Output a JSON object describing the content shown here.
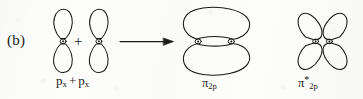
{
  "figure": {
    "panel_label": "(b)",
    "type": "molecular-orbital-diagram",
    "ink_color": "#1a1a1a",
    "background_color": "#fdfdfb"
  },
  "reactants": {
    "left_orbital_name": "p-orbital",
    "right_orbital_name": "p-orbital",
    "operator": "+",
    "caption": {
      "first_symbol": "p",
      "first_subscript": "x",
      "operator": "+",
      "second_symbol": "p",
      "second_subscript": "x"
    }
  },
  "arrow": {
    "name": "reaction-arrow",
    "direction": "right"
  },
  "products": [
    {
      "name": "pi-bonding-orbital",
      "caption_symbol": "π",
      "caption_star": "",
      "caption_subscript": "2p",
      "description": "two merged lobes"
    },
    {
      "name": "pi-antibonding-orbital",
      "caption_symbol": "π",
      "caption_star": "*",
      "caption_subscript": "2p",
      "description": "four separate lobes"
    }
  ]
}
